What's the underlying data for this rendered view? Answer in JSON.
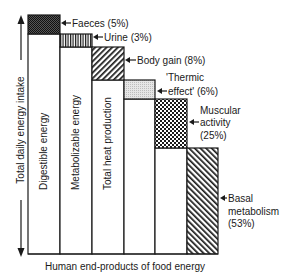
{
  "figure": {
    "axis_label": "Total daily energy intake",
    "caption": "Human end-products of food energy",
    "columns": [
      {
        "label": "Digestible energy"
      },
      {
        "label": "Metabolizable energy"
      },
      {
        "label": "Total heat production"
      }
    ],
    "components": [
      {
        "name": "Faeces",
        "percent": "5%",
        "label_lines": [
          "Faeces (5%)"
        ],
        "pattern": "dense-stipple"
      },
      {
        "name": "Urine",
        "percent": "3%",
        "label_lines": [
          "Urine (3%)"
        ],
        "pattern": "vertical-lines"
      },
      {
        "name": "Body gain",
        "percent": "8%",
        "label_lines": [
          "Body gain (8%)"
        ],
        "pattern": "diagonal-back-hatch"
      },
      {
        "name": "'Thermic effect'",
        "percent": "6%",
        "label_lines": [
          "'Thermic",
          "effect' (6%)"
        ],
        "pattern": "light-dots"
      },
      {
        "name": "Muscular activity",
        "percent": "25%",
        "label_lines": [
          "Muscular",
          "activity",
          "(25%)"
        ],
        "pattern": "checkerboard"
      },
      {
        "name": "Basal metabolism",
        "percent": "53%",
        "label_lines": [
          "Basal",
          "metabolism",
          "(53%)"
        ],
        "pattern": "diagonal-forward-hatch"
      }
    ],
    "colors": {
      "line": "#1a1a1a",
      "background": "#ffffff",
      "light_fill": "#d9d9d9"
    }
  }
}
